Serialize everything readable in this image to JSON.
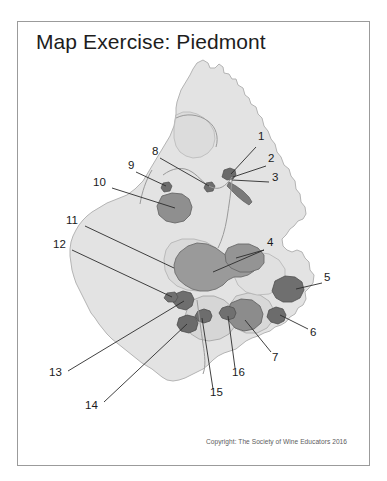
{
  "document": {
    "title": "Map Exercise: Piedmont",
    "copyright": "Copyright:  The Society of Wine Educators 2016"
  },
  "colors": {
    "page_background": "#ffffff",
    "frame_border": "#9b9b9b",
    "title_text": "#1d1d1d",
    "copyright_text": "#5c5c5c",
    "label_text": "#1a1a1a",
    "base_map_fill": "#e3e3e3",
    "base_map_stroke": "#b4b4b4",
    "subregion_light_fill": "#d2d2d2",
    "subregion_mid_fill": "#9a9a9a",
    "subregion_dark_fill": "#6f6f6f",
    "subregion_stroke": "#6d6d6d",
    "river_stroke": "#9a9a9a",
    "leader_line": "#2b2b2b"
  },
  "map": {
    "region_name": "Piedmont",
    "labels": [
      {
        "id": "1",
        "text": "1",
        "x": 258,
        "y": 136,
        "leader": {
          "x1": 256,
          "y1": 147,
          "x2": 231,
          "y2": 174
        }
      },
      {
        "id": "2",
        "text": "2",
        "x": 268,
        "y": 158,
        "leader": {
          "x1": 266,
          "y1": 166,
          "x2": 233,
          "y2": 177
        }
      },
      {
        "id": "3",
        "text": "3",
        "x": 272,
        "y": 177,
        "leader": {
          "x1": 269,
          "y1": 182,
          "x2": 232,
          "y2": 180
        }
      },
      {
        "id": "4",
        "text": "4",
        "x": 267,
        "y": 242,
        "leader": {
          "x1": 264,
          "y1": 250,
          "x2": 213,
          "y2": 272
        }
      },
      {
        "id": "4b",
        "text": "",
        "x": 0,
        "y": 0,
        "leader": {
          "x1": 264,
          "y1": 250,
          "x2": 236,
          "y2": 258
        }
      },
      {
        "id": "5",
        "text": "5",
        "x": 324,
        "y": 277,
        "leader": {
          "x1": 322,
          "y1": 283,
          "x2": 296,
          "y2": 289
        }
      },
      {
        "id": "6",
        "text": "6",
        "x": 310,
        "y": 330,
        "leader": {
          "x1": 308,
          "y1": 329,
          "x2": 280,
          "y2": 315
        }
      },
      {
        "id": "7",
        "text": "7",
        "x": 272,
        "y": 355,
        "leader": {
          "x1": 271,
          "y1": 352,
          "x2": 245,
          "y2": 320
        }
      },
      {
        "id": "8",
        "text": "8",
        "x": 152,
        "y": 151,
        "leader": {
          "x1": 160,
          "y1": 158,
          "x2": 209,
          "y2": 186
        }
      },
      {
        "id": "9",
        "text": "9",
        "x": 128,
        "y": 165,
        "leader": {
          "x1": 136,
          "y1": 172,
          "x2": 166,
          "y2": 186
        }
      },
      {
        "id": "10",
        "text": "10",
        "x": 95,
        "y": 182,
        "leader": {
          "x1": 112,
          "y1": 188,
          "x2": 175,
          "y2": 208
        }
      },
      {
        "id": "11",
        "text": "11",
        "x": 68,
        "y": 220,
        "leader": {
          "x1": 85,
          "y1": 226,
          "x2": 174,
          "y2": 268
        }
      },
      {
        "id": "12",
        "text": "12",
        "x": 55,
        "y": 244,
        "leader": {
          "x1": 72,
          "y1": 250,
          "x2": 172,
          "y2": 297
        }
      },
      {
        "id": "13",
        "text": "13",
        "x": 51,
        "y": 372,
        "leader": {
          "x1": 68,
          "y1": 371,
          "x2": 184,
          "y2": 301
        }
      },
      {
        "id": "14",
        "text": "14",
        "x": 87,
        "y": 405,
        "leader": {
          "x1": 104,
          "y1": 402,
          "x2": 187,
          "y2": 324
        }
      },
      {
        "id": "15",
        "text": "15",
        "x": 212,
        "y": 392,
        "leader": {
          "x1": 213,
          "y1": 389,
          "x2": 202,
          "y2": 318
        }
      },
      {
        "id": "16",
        "text": "16",
        "x": 234,
        "y": 372,
        "leader": {
          "x1": 235,
          "y1": 368,
          "x2": 228,
          "y2": 316
        }
      }
    ]
  }
}
